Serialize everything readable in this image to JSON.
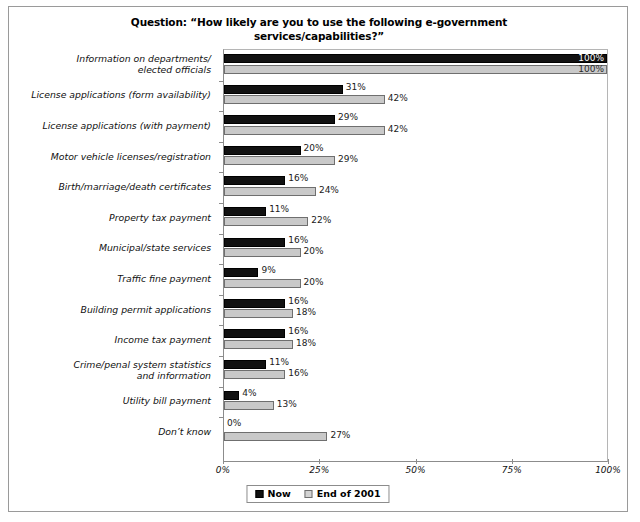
{
  "figure": {
    "title_lines": [
      "Question:  “How likely are you to use the following e-government",
      "services/capabilities?”"
    ],
    "border_color": "#9a9a9a"
  },
  "legend": {
    "position": "bottom-center",
    "items": [
      {
        "label": "Now",
        "color": "#111111",
        "swatch": "now"
      },
      {
        "label": "End of 2001",
        "color": "#c9c9c9",
        "swatch": "end"
      }
    ]
  },
  "axis": {
    "x_ticks": [
      "0%",
      "25%",
      "50%",
      "75%",
      "100%"
    ],
    "x_tick_values": [
      0,
      25,
      50,
      75,
      100
    ]
  },
  "chart_data": {
    "type": "bar",
    "orientation": "horizontal",
    "xlabel": "",
    "ylabel": "",
    "xlim": [
      0,
      100
    ],
    "grid": false,
    "legend_position": "bottom-center",
    "value_suffix": "%",
    "categories": [
      "Information on departments/\nelected officials",
      "License applications (form availability)",
      "License applications (with payment)",
      "Motor vehicle licenses/registration",
      "Birth/marriage/death certificates",
      "Property tax payment",
      "Municipal/state services",
      "Traffic fine payment",
      "Building permit applications",
      "Income tax payment",
      "Crime/penal system statistics\nand information",
      "Utility bill payment",
      "Don’t know"
    ],
    "series": [
      {
        "name": "Now",
        "color": "#111111",
        "values": [
          100,
          31,
          29,
          20,
          16,
          11,
          16,
          9,
          16,
          16,
          11,
          4,
          0
        ]
      },
      {
        "name": "End of 2001",
        "color": "#c9c9c9",
        "values": [
          100,
          42,
          42,
          29,
          24,
          22,
          20,
          20,
          18,
          18,
          16,
          13,
          27
        ]
      }
    ]
  },
  "rows": [
    {
      "label_lines": [
        "Information on departments/",
        "elected officials"
      ],
      "now": 100,
      "end": 100,
      "now_label": "100%",
      "end_label": "100%",
      "now_inside": true,
      "end_inside": true
    },
    {
      "label_lines": [
        "License applications (form availability)"
      ],
      "now": 31,
      "end": 42,
      "now_label": "31%",
      "end_label": "42%",
      "now_inside": false,
      "end_inside": false
    },
    {
      "label_lines": [
        "License applications (with payment)"
      ],
      "now": 29,
      "end": 42,
      "now_label": "29%",
      "end_label": "42%",
      "now_inside": false,
      "end_inside": false
    },
    {
      "label_lines": [
        "Motor vehicle licenses/registration"
      ],
      "now": 20,
      "end": 29,
      "now_label": "20%",
      "end_label": "29%",
      "now_inside": false,
      "end_inside": false
    },
    {
      "label_lines": [
        "Birth/marriage/death certificates"
      ],
      "now": 16,
      "end": 24,
      "now_label": "16%",
      "end_label": "24%",
      "now_inside": false,
      "end_inside": false
    },
    {
      "label_lines": [
        "Property tax payment"
      ],
      "now": 11,
      "end": 22,
      "now_label": "11%",
      "end_label": "22%",
      "now_inside": false,
      "end_inside": false
    },
    {
      "label_lines": [
        "Municipal/state services"
      ],
      "now": 16,
      "end": 20,
      "now_label": "16%",
      "end_label": "20%",
      "now_inside": false,
      "end_inside": false
    },
    {
      "label_lines": [
        "Traffic fine payment"
      ],
      "now": 9,
      "end": 20,
      "now_label": "9%",
      "end_label": "20%",
      "now_inside": false,
      "end_inside": false
    },
    {
      "label_lines": [
        "Building permit applications"
      ],
      "now": 16,
      "end": 18,
      "now_label": "16%",
      "end_label": "18%",
      "now_inside": false,
      "end_inside": false
    },
    {
      "label_lines": [
        "Income tax payment"
      ],
      "now": 16,
      "end": 18,
      "now_label": "16%",
      "end_label": "18%",
      "now_inside": false,
      "end_inside": false
    },
    {
      "label_lines": [
        "Crime/penal system statistics",
        "and information"
      ],
      "now": 11,
      "end": 16,
      "now_label": "11%",
      "end_label": "16%",
      "now_inside": false,
      "end_inside": false
    },
    {
      "label_lines": [
        "Utility bill payment"
      ],
      "now": 4,
      "end": 13,
      "now_label": "4%",
      "end_label": "13%",
      "now_inside": false,
      "end_inside": false
    },
    {
      "label_lines": [
        "Don’t know"
      ],
      "now": 0,
      "end": 27,
      "now_label": "0%",
      "end_label": "27%",
      "now_inside": false,
      "end_inside": false
    }
  ]
}
